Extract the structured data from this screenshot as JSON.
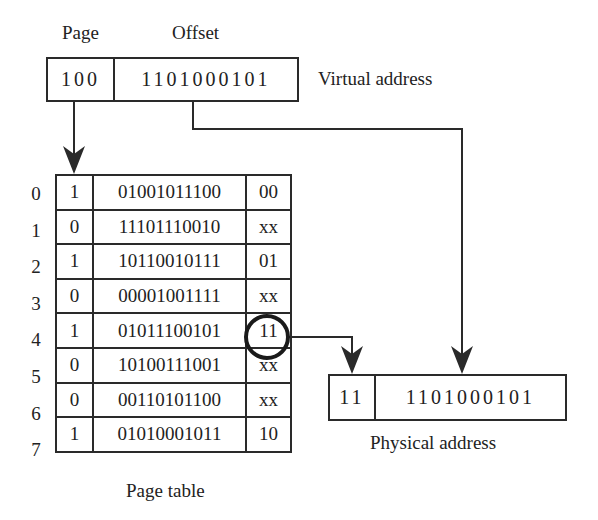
{
  "virtual_address": {
    "page_header": "Page",
    "offset_header": "Offset",
    "page_bits": "100",
    "offset_bits": "1101000101",
    "label": "Virtual address"
  },
  "page_table": {
    "label": "Page table",
    "rows": [
      {
        "index": "0",
        "valid": "1",
        "frame": "01001011100",
        "protection": "00"
      },
      {
        "index": "1",
        "valid": "0",
        "frame": "11101110010",
        "protection": "xx"
      },
      {
        "index": "2",
        "valid": "1",
        "frame": "10110010111",
        "protection": "01"
      },
      {
        "index": "3",
        "valid": "0",
        "frame": "00001001111",
        "protection": "xx"
      },
      {
        "index": "4",
        "valid": "1",
        "frame": "01011100101",
        "protection": "11"
      },
      {
        "index": "5",
        "valid": "0",
        "frame": "10100111001",
        "protection": "xx"
      },
      {
        "index": "6",
        "valid": "0",
        "frame": "00110101100",
        "protection": "xx"
      },
      {
        "index": "7",
        "valid": "1",
        "frame": "01010001011",
        "protection": "10"
      }
    ],
    "highlighted_row": 4
  },
  "physical_address": {
    "high_bits": "11",
    "offset_bits": "1101000101",
    "label": "Physical address"
  },
  "colors": {
    "line": "#2a2a2a",
    "background": "#ffffff"
  }
}
